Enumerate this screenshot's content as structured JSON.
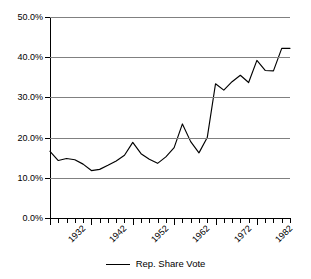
{
  "chart_data": {
    "type": "line",
    "title": "",
    "xlabel": "",
    "ylabel": "",
    "xlim": [
      1932,
      1990
    ],
    "ylim": [
      0,
      50
    ],
    "grid": true,
    "legend_position": "bottom",
    "y_ticks": [
      0,
      10,
      20,
      30,
      40,
      50
    ],
    "y_tick_labels": [
      "0.0%",
      "10.0%",
      "20.0%",
      "30.0%",
      "40.0%",
      "50.0%"
    ],
    "x_tick_labels": [
      "1932",
      "1942",
      "1952",
      "1962",
      "1972",
      "1982"
    ],
    "x_tick_values": [
      1932,
      1942,
      1952,
      1962,
      1972,
      1982
    ],
    "x_minor_step": 2,
    "series": [
      {
        "name": "Rep. Share Vote",
        "color": "#000000",
        "x": [
          1932,
          1934,
          1936,
          1938,
          1940,
          1942,
          1944,
          1946,
          1948,
          1950,
          1952,
          1954,
          1956,
          1958,
          1960,
          1962,
          1964,
          1966,
          1968,
          1970,
          1972,
          1974,
          1976,
          1978,
          1980,
          1982,
          1984,
          1986,
          1988,
          1990
        ],
        "values": [
          16.6,
          14.3,
          14.8,
          14.5,
          13.4,
          11.8,
          12.1,
          13.1,
          14.2,
          15.6,
          18.8,
          16.0,
          14.6,
          13.6,
          15.2,
          17.5,
          23.4,
          19.0,
          16.2,
          20.0,
          33.4,
          31.8,
          33.9,
          35.5,
          33.7,
          39.2,
          36.7,
          36.6,
          42.2,
          42.2
        ],
        "note": "values read from gridlines; biennial series"
      }
    ]
  },
  "legend": {
    "entries": [
      {
        "label": "Rep. Share Vote",
        "color": "#000000"
      }
    ]
  },
  "axes": {
    "y": {
      "min": 0,
      "max": 50,
      "step": 10,
      "unit": "%"
    },
    "x": {
      "min": 1932,
      "max": 1990,
      "step": 2,
      "label_step": 10
    }
  }
}
